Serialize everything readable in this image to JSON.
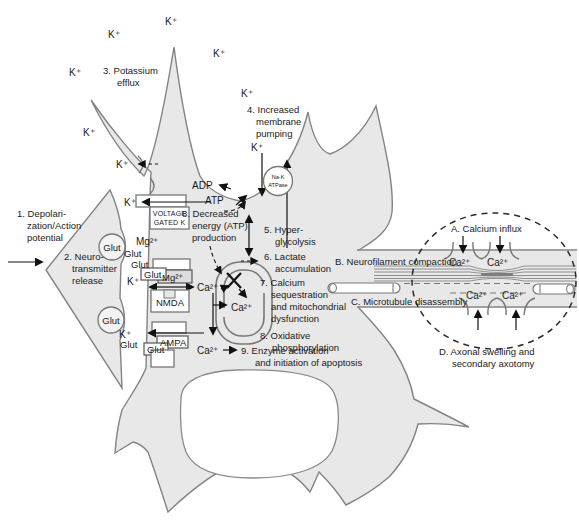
{
  "ions": {
    "k": "K⁺",
    "ca": "Ca²⁺",
    "mg": "Mg²⁺",
    "glut": "Glut",
    "atp": "ATP",
    "adp": "ADP"
  },
  "pump": {
    "line1": "Na-K",
    "line2": "ATPase"
  },
  "receptors": {
    "voltage_gated_1": "VOLTAGE",
    "voltage_gated_2": "GATED K",
    "nmda": "NMDA",
    "ampa": "AMPA"
  },
  "steps": {
    "s1": [
      "1. Depolari-",
      "zation/Action",
      "potential"
    ],
    "s2": [
      "2. Neuro-",
      "transmitter",
      "release"
    ],
    "s3": [
      "3. Potassium",
      "efflux"
    ],
    "s4": [
      "4. Increased",
      "membrane",
      "pumping"
    ],
    "s5": [
      "5. Hyper-",
      "glycolysis"
    ],
    "s6": [
      "6. Lactate",
      "accumulation"
    ],
    "s7": [
      "7. Calcium",
      "sequestration",
      "and mitochondrial",
      "dysfunction"
    ],
    "s8a": [
      "8. Decreased",
      "energy (ATP)",
      "production"
    ],
    "s8b": [
      "8. Oxidative",
      "phosphorylation"
    ],
    "s9": [
      "9. Enzyme activation",
      "and initiation of apoptosis"
    ]
  },
  "axon": {
    "a": "A. Calcium influx",
    "b": "B. Neurofilament compaction",
    "c": "C. Microtubule disassembly",
    "d": [
      "D. Axonal swelling and",
      "secondary axotomy"
    ]
  },
  "colors": {
    "cell_fill": "#e8e8e8",
    "membrane": "#838383",
    "text": "#1a1a1a",
    "accent_black": "#111111"
  }
}
